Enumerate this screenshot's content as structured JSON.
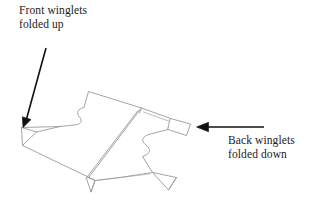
{
  "figure": {
    "kind": "line-drawing",
    "background_color": "#ffffff",
    "line_color": "#9a9a9a",
    "arrow_color": "#101010",
    "text_color": "#1a1a1a"
  },
  "labels": {
    "front": {
      "name": "front-winglets-label",
      "line1": "Front winglets",
      "line2": "folded up"
    },
    "back": {
      "name": "back-winglets-label",
      "line1": "Back winglets",
      "line2": "folded down"
    }
  },
  "arrows": [
    {
      "name": "front-winglets-arrow",
      "from": [
        46,
        48
      ],
      "to": [
        23,
        126
      ],
      "direction": "down-left",
      "points_at": "front-winglet-fold"
    },
    {
      "name": "back-winglets-arrow",
      "from": [
        264,
        127
      ],
      "to": [
        197,
        127
      ],
      "direction": "left",
      "points_at": "back-winglet-fold"
    }
  ],
  "drawing_parts": [
    "body-outline",
    "center-crease",
    "front-left-winglet",
    "back-right-winglet",
    "lower-left-winglet",
    "lower-right-winglet"
  ]
}
